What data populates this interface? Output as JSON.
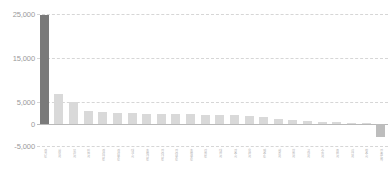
{
  "chart_data": {
    "type": "bar",
    "title": "",
    "subtitle": "",
    "xlabel": "",
    "ylabel": "",
    "ylim": [
      -5000,
      25000
    ],
    "grid": true,
    "legend": null,
    "yticks": [
      "25,000",
      "15,000",
      "5,000",
      "0",
      "-5,000"
    ],
    "ytick_values": [
      25000,
      15000,
      5000,
      0,
      -5000
    ],
    "highlight_index": 0,
    "colors": {
      "highlight_bar": "#7a7a7a",
      "bar": "#d9d9d9",
      "negative_bar": "#bdbdbd",
      "gridline": "#d6d6d6",
      "zero_axis": "#b9b9b9",
      "tick_text": "#9a9a9a",
      "label_text": "#b0b0b0",
      "background": "#ffffff"
    },
    "categories": [
      "경기도",
      "서울시",
      "부산시",
      "인천시",
      "경상남도",
      "경상북도",
      "대구시",
      "충청남도",
      "전라남도",
      "전라북도",
      "충청북도",
      "강원도",
      "대전시",
      "광주시",
      "울산시",
      "제주도",
      "세종시",
      "창원시",
      "고양시",
      "수원시",
      "용인시",
      "성남시",
      "청주시",
      "전출입차"
    ],
    "values": [
      24800,
      6900,
      5100,
      2900,
      2700,
      2500,
      2400,
      2350,
      2300,
      2250,
      2200,
      2100,
      2050,
      1950,
      1850,
      1500,
      1200,
      950,
      700,
      500,
      350,
      250,
      150,
      -3000
    ]
  }
}
